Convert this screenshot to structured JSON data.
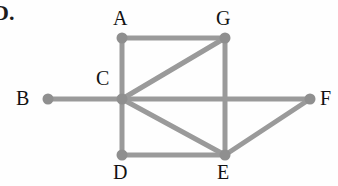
{
  "problem": {
    "number_label": "D."
  },
  "canvas": {
    "width": 338,
    "height": 186,
    "background_color": "#fefefe"
  },
  "graph": {
    "type": "undirected-graph",
    "edge_color": "#9a9a9a",
    "node_color": "#8f8f8f",
    "label_color": "#121212",
    "edge_width": 5,
    "node_radius": 5.5,
    "nodes": [
      {
        "id": "A",
        "label": "A",
        "x": 122,
        "y": 38,
        "label_x": 113,
        "label_y": 8
      },
      {
        "id": "B",
        "label": "B",
        "x": 48,
        "y": 99,
        "label_x": 16,
        "label_y": 88
      },
      {
        "id": "C",
        "label": "C",
        "x": 122,
        "y": 99,
        "label_x": 96,
        "label_y": 68
      },
      {
        "id": "D",
        "label": "D",
        "x": 122,
        "y": 155,
        "label_x": 113,
        "label_y": 162
      },
      {
        "id": "E",
        "label": "E",
        "x": 225,
        "y": 155,
        "label_x": 217,
        "label_y": 162
      },
      {
        "id": "F",
        "label": "F",
        "x": 310,
        "y": 99,
        "label_x": 320,
        "label_y": 88
      },
      {
        "id": "G",
        "label": "G",
        "x": 225,
        "y": 38,
        "label_x": 216,
        "label_y": 8
      }
    ],
    "edges": [
      {
        "from": "A",
        "to": "G"
      },
      {
        "from": "A",
        "to": "C"
      },
      {
        "from": "C",
        "to": "G"
      },
      {
        "from": "G",
        "to": "E"
      },
      {
        "from": "B",
        "to": "C"
      },
      {
        "from": "C",
        "to": "F"
      },
      {
        "from": "C",
        "to": "E"
      },
      {
        "from": "C",
        "to": "D"
      },
      {
        "from": "D",
        "to": "E"
      },
      {
        "from": "E",
        "to": "F"
      }
    ]
  }
}
